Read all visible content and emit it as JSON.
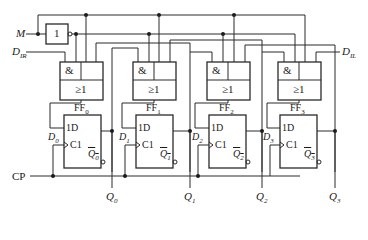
{
  "diagram": {
    "type": "4-bit bidirectional shift register (logic schematic)",
    "inputs": {
      "mode": "M",
      "right_serial": {
        "base": "D",
        "sub": "IR"
      },
      "left_serial": {
        "base": "D",
        "sub": "IL"
      },
      "clock": "CP"
    },
    "inverter": {
      "label": "1"
    },
    "gates": [
      {
        "and_label": "&",
        "or_label": "≥1"
      },
      {
        "and_label": "&",
        "or_label": "≥1"
      },
      {
        "and_label": "&",
        "or_label": "≥1"
      },
      {
        "and_label": "&",
        "or_label": "≥1"
      }
    ],
    "flipflops": [
      {
        "name": "FF",
        "idx": "0",
        "d_pin": "1D",
        "c_pin": "C1",
        "d_label": "D",
        "q_out": "Q",
        "qbar": "Q"
      },
      {
        "name": "FF",
        "idx": "1",
        "d_pin": "1D",
        "c_pin": "C1",
        "d_label": "D",
        "q_out": "Q",
        "qbar": "Q"
      },
      {
        "name": "FF",
        "idx": "2",
        "d_pin": "1D",
        "c_pin": "C1",
        "d_label": "D",
        "q_out": "Q",
        "qbar": "Q"
      },
      {
        "name": "FF",
        "idx": "3",
        "d_pin": "1D",
        "c_pin": "C1",
        "d_label": "D",
        "q_out": "Q",
        "qbar": "Q"
      }
    ],
    "colors": {
      "line": "#2a2a2a",
      "background": "#ffffff"
    }
  }
}
